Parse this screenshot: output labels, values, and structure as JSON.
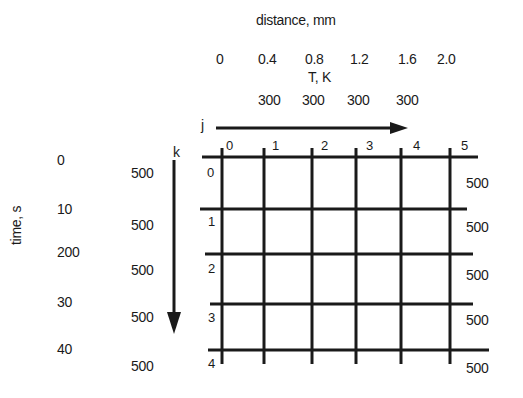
{
  "figure": {
    "x_axis_title": "distance, mm",
    "distance_ticks": [
      "0",
      "0.4",
      "0.8",
      "1.2",
      "1.6",
      "2.0"
    ],
    "temperature_title": "T, K",
    "top_temperatures": [
      "300",
      "300",
      "300",
      "300"
    ],
    "j_label": "j",
    "j_indices": [
      "0",
      "1",
      "2",
      "3",
      "4",
      "5"
    ],
    "k_label": "k",
    "k_indices": [
      "0",
      "1",
      "2",
      "3",
      "4"
    ],
    "y_axis_title": "time, s",
    "time_ticks": [
      "0",
      "10",
      "200",
      "30",
      "40"
    ],
    "left_temperatures": [
      "500",
      "500",
      "500",
      "500",
      "500"
    ],
    "right_temperatures": [
      "500",
      "500",
      "500",
      "500",
      "500"
    ],
    "line_color": "#1a1a1a"
  }
}
